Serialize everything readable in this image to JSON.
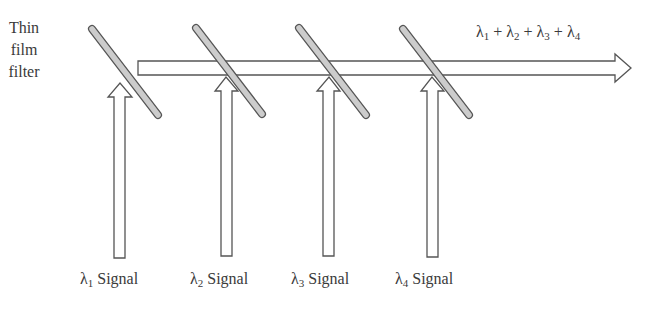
{
  "diagram": {
    "filter_label": [
      "Thin",
      "film",
      "filter"
    ],
    "output_label": {
      "terms": [
        {
          "sym": "λ",
          "sub": "1"
        },
        {
          "sym": "λ",
          "sub": "2"
        },
        {
          "sym": "λ",
          "sub": "3"
        },
        {
          "sym": "λ",
          "sub": "4"
        }
      ],
      "operator": "+"
    },
    "signals": [
      {
        "sym": "λ",
        "sub": "1",
        "text": "Signal",
        "x": 80
      },
      {
        "sym": "λ",
        "sub": "2",
        "text": "Signal",
        "x": 190
      },
      {
        "sym": "λ",
        "sub": "3",
        "text": "Signal",
        "x": 291
      },
      {
        "sym": "λ",
        "sub": "4",
        "text": "Signal",
        "x": 395
      }
    ],
    "colors": {
      "stroke": "#555555",
      "filter_fill": "#cccccc",
      "arrow_fill": "#ffffff",
      "text": "#3a3a3a"
    }
  }
}
